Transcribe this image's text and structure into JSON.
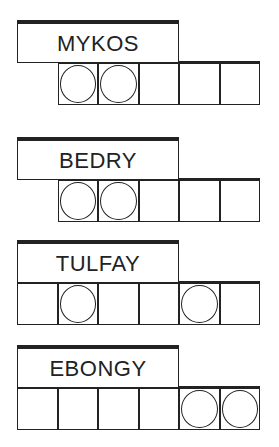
{
  "puzzle": {
    "type": "word-jumble",
    "words": [
      {
        "scrambled": "MYKOS",
        "top": 20,
        "cells": 5,
        "start_col": 1,
        "circled": [
          0,
          1
        ]
      },
      {
        "scrambled": "BEDRY",
        "top": 137,
        "cells": 5,
        "start_col": 1,
        "circled": [
          0,
          1
        ]
      },
      {
        "scrambled": "TULFAY",
        "top": 240,
        "cells": 6,
        "start_col": 0,
        "circled": [
          1,
          4
        ]
      },
      {
        "scrambled": "EBONGY",
        "top": 345,
        "cells": 6,
        "start_col": 0,
        "circled": [
          4,
          5
        ]
      }
    ]
  }
}
